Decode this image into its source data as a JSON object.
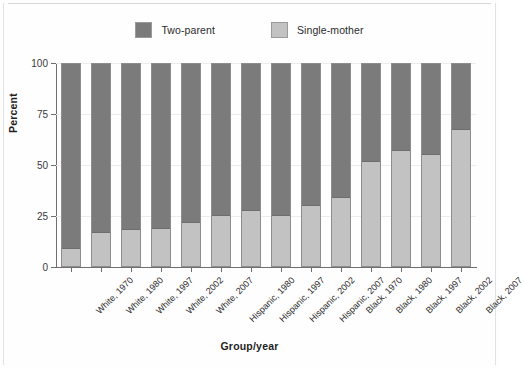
{
  "legend": {
    "items": [
      {
        "label": "Two-parent",
        "color": "#7b7b7b",
        "swatch_name": "legend-swatch-two-parent"
      },
      {
        "label": "Single-mother",
        "color": "#c2c2c2",
        "swatch_name": "legend-swatch-single-mother"
      }
    ]
  },
  "chart_data": {
    "type": "bar",
    "title": "",
    "subtitle": "",
    "xlabel": "Group/year",
    "ylabel": "Percent",
    "ylim": [
      0,
      100
    ],
    "yticks": [
      0,
      25,
      50,
      75,
      100
    ],
    "ytick_labels": [
      "0",
      "25",
      "50",
      "75",
      "100"
    ],
    "grid": true,
    "stacked": true,
    "legend_position": "top-center",
    "categories": [
      "White, 1970",
      "White, 1980",
      "White, 1997",
      "White, 2002",
      "White, 2007",
      "Hispanic, 1980",
      "Hispanic, 1997",
      "Hispanic, 2002",
      "Hispanic, 2007",
      "Black, 1970",
      "Black, 1980",
      "Black, 1997",
      "Black, 2002",
      "Black, 2007"
    ],
    "series": [
      {
        "name": "Single-mother",
        "color": "#c2c2c2",
        "values": [
          10,
          17.5,
          19,
          19.5,
          22.5,
          26,
          28.5,
          26,
          31,
          35,
          52.5,
          58,
          56,
          68
        ]
      },
      {
        "name": "Two-parent",
        "color": "#7b7b7b",
        "values": [
          90,
          82.5,
          81,
          80.5,
          77.5,
          74,
          71.5,
          74,
          69,
          65,
          47.5,
          42,
          44,
          32
        ]
      }
    ]
  }
}
